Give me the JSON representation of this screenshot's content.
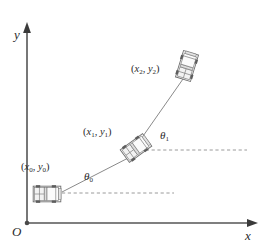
{
  "figure": {
    "background_color": "#ffffff",
    "line_color": "#6b6b6b",
    "axis_color": "#555555",
    "text_color": "#2b2b2b",
    "dashed_color": "#9a9a9a"
  },
  "axes": {
    "y_label": "y",
    "x_label": "x",
    "origin_label": "O",
    "y_axis": {
      "x": 27,
      "y_bottom": 223,
      "y_top": 25
    },
    "x_axis": {
      "y": 223,
      "x_left": 27,
      "x_right": 258
    }
  },
  "poses": [
    {
      "id": "pose-0",
      "coord_open": "(",
      "coord_x": "x",
      "coord_x_sub": "0",
      "coord_sep": ", ",
      "coord_y": "y",
      "coord_y_sub": "0",
      "coord_close": ")",
      "coord_text": "(x0, y0)",
      "center_x": 47,
      "center_y": 194,
      "heading_deg": 0,
      "angle_label": "θ",
      "angle_sub": "0",
      "angle_text": "θ0"
    },
    {
      "id": "pose-1",
      "coord_open": "(",
      "coord_x": "x",
      "coord_x_sub": "1",
      "coord_sep": ", ",
      "coord_y": "y",
      "coord_y_sub": "1",
      "coord_close": ")",
      "coord_text": "(x1, y1)",
      "center_x": 136,
      "center_y": 148,
      "heading_deg": -36,
      "angle_label": "θ",
      "angle_sub": "1",
      "angle_text": "θ1"
    },
    {
      "id": "pose-2",
      "coord_open": "(",
      "coord_x": "x",
      "coord_x_sub": "2",
      "coord_sep": ", ",
      "coord_y": "y",
      "coord_y_sub": "2",
      "coord_close": ")",
      "coord_text": "(x2, y2)",
      "center_x": 187,
      "center_y": 66,
      "heading_deg": -73,
      "angle_label": null,
      "angle_sub": null,
      "angle_text": null
    }
  ],
  "reference_lines": [
    {
      "id": "dashed-0",
      "x1": 62,
      "y1": 193,
      "x2": 174,
      "y2": 193
    },
    {
      "id": "dashed-1",
      "x1": 140,
      "y1": 150,
      "x2": 247,
      "y2": 150
    }
  ],
  "path_segments": [
    {
      "id": "segment-0-1",
      "x1": 62,
      "y1": 192,
      "x2": 134,
      "y2": 155
    },
    {
      "id": "segment-1-2",
      "x1": 141,
      "y1": 139,
      "x2": 183,
      "y2": 79
    }
  ],
  "icons": {
    "car": "car-top-view-icon",
    "y_arrow": "arrow-up-icon",
    "x_arrow": "arrow-right-icon",
    "origin_dot": "origin-dot-icon"
  }
}
